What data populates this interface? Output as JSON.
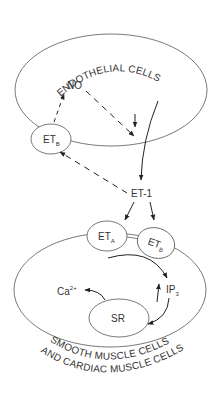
{
  "diagram": {
    "top_cell": {
      "label": "ENDOTHELIAL CELLS"
    },
    "bottom_cell": {
      "label_line1": "SMOOTH MUSCLE CELLS",
      "label_line2": "AND CARDIAC MUSCLE CELLS"
    },
    "nodes": {
      "no": {
        "label": "NO"
      },
      "et1": {
        "label": "ET-1"
      },
      "etb_endothelial": {
        "base": "ET",
        "sub": "B"
      },
      "eta": {
        "base": "ET",
        "sub": "A"
      },
      "etb_muscle": {
        "base": "ET",
        "sub": "B"
      },
      "ca": {
        "base": "Ca",
        "sup": "2+"
      },
      "ip3": {
        "base": "IP",
        "sub": "3"
      },
      "sr": {
        "label": "SR"
      }
    },
    "edges": [
      {
        "from": "ETB (endothelial)",
        "to": "NO",
        "style": "dashed"
      },
      {
        "from": "NO",
        "to": "inside endothelial cell",
        "style": "dashed"
      },
      {
        "from": "endothelial cell",
        "to": "ET-1",
        "style": "solid"
      },
      {
        "from": "ET-1",
        "to": "ETB (endothelial)",
        "style": "dashed"
      },
      {
        "from": "ET-1",
        "to": "ETA",
        "style": "solid"
      },
      {
        "from": "ET-1",
        "to": "ETB (muscle)",
        "style": "solid"
      },
      {
        "from": "receptors",
        "to": "IP3",
        "style": "solid"
      },
      {
        "from": "IP3",
        "to": "SR",
        "style": "solid"
      },
      {
        "from": "SR",
        "to": "Ca2+",
        "style": "solid"
      }
    ],
    "colors": {
      "outline": "#6a6a6a",
      "arrow": "#222222",
      "text": "#333333",
      "background": "#ffffff"
    }
  }
}
